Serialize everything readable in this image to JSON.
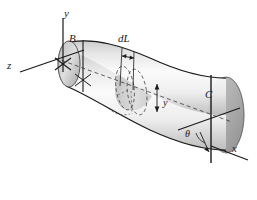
{
  "figure": {
    "background_color": "#ffffff",
    "line_color": "#1a1a1a",
    "body_fill_light": "#f2f2f2",
    "body_fill_mid": "#d8d8d8",
    "body_fill_dark": "#a8a8a8"
  },
  "axes": {
    "y_label": "y",
    "z_label": "z",
    "x_label": "x"
  },
  "points": {
    "B_label": "B",
    "C_label": "C"
  },
  "dimensions": {
    "element_length_label": "dL",
    "radius_label": "y",
    "angle_label": "θ"
  }
}
